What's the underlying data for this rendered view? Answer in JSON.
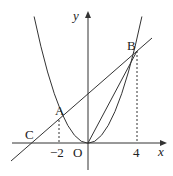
{
  "diagram": {
    "type": "coordinate-geometry",
    "axes": {
      "x_label": "x",
      "y_label": "y",
      "origin_label": "O"
    },
    "curve": {
      "equation": "y = x^2/2",
      "kind": "parabola"
    },
    "line": {
      "equation": "y = x + 4",
      "passes_through": [
        "C",
        "A",
        "B"
      ]
    },
    "points": [
      {
        "name": "A",
        "x": -2,
        "y": 2
      },
      {
        "name": "B",
        "x": 4,
        "y": 8
      },
      {
        "name": "C",
        "x": -4,
        "y": 0
      },
      {
        "name": "O",
        "x": 0,
        "y": 0
      }
    ],
    "tick_labels": {
      "neg_two": "−2",
      "four": "4"
    },
    "labels": {
      "A": "A",
      "B": "B",
      "C": "C",
      "O": "O"
    },
    "segments": [
      "OB"
    ],
    "dashed": [
      "A to x-axis at -2",
      "B to x-axis at 4"
    ],
    "stroke_color": "#333333"
  }
}
